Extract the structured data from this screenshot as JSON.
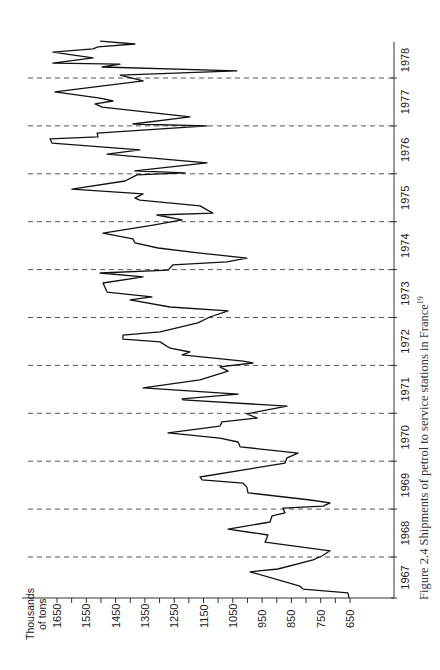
{
  "chart_data": {
    "type": "line",
    "orientation": "rotated-90",
    "title": "Figure 2.4   Shipments of petrol to service stations in France",
    "title_superscript": "19",
    "xlabel": "",
    "ylabel": "Thousands of tons",
    "ylabel_lines": [
      "Thousands",
      "of  tons"
    ],
    "ylim": [
      650,
      1650
    ],
    "yticks": [
      1650,
      1550,
      1450,
      1350,
      1250,
      1150,
      1050,
      950,
      850,
      750,
      650
    ],
    "xlim": [
      1967,
      1979
    ],
    "xticks": [
      "1967",
      "1968",
      "1969",
      "1970",
      "1971",
      "1972",
      "1973",
      "1974",
      "1975",
      "1976",
      "1977",
      "1978"
    ],
    "year_boundaries": [
      1968,
      1969,
      1970,
      1971,
      1972,
      1973,
      1974,
      1975,
      1976,
      1977,
      1978
    ],
    "grid": "dashed lines at year boundaries",
    "legend": "none",
    "series": [
      {
        "name": "Petrol shipments",
        "points": [
          [
            1967.14,
            653
          ],
          [
            1967.25,
            657
          ],
          [
            1967.33,
            810
          ],
          [
            1967.39,
            821
          ],
          [
            1967.69,
            991
          ],
          [
            1967.75,
            896
          ],
          [
            1967.94,
            776
          ],
          [
            1968.02,
            746
          ],
          [
            1968.13,
            718
          ],
          [
            1968.31,
            940
          ],
          [
            1968.46,
            930
          ],
          [
            1968.58,
            1066
          ],
          [
            1968.73,
            923
          ],
          [
            1968.86,
            916
          ],
          [
            1968.92,
            872
          ],
          [
            1969.02,
            879
          ],
          [
            1969.06,
            742
          ],
          [
            1969.13,
            718
          ],
          [
            1969.19,
            786
          ],
          [
            1969.34,
            998
          ],
          [
            1969.46,
            1002
          ],
          [
            1969.54,
            1015
          ],
          [
            1969.61,
            1155
          ],
          [
            1969.67,
            1162
          ],
          [
            1969.96,
            872
          ],
          [
            1970.07,
            865
          ],
          [
            1970.17,
            827
          ],
          [
            1970.3,
            1025
          ],
          [
            1970.4,
            1032
          ],
          [
            1970.48,
            1094
          ],
          [
            1970.59,
            1271
          ],
          [
            1970.73,
            1094
          ],
          [
            1970.82,
            1087
          ],
          [
            1970.9,
            967
          ],
          [
            1970.99,
            1002
          ],
          [
            1971.15,
            865
          ],
          [
            1971.28,
            1220
          ],
          [
            1971.3,
            1223
          ],
          [
            1971.4,
            1032
          ],
          [
            1971.53,
            1356
          ],
          [
            1971.7,
            1162
          ],
          [
            1971.88,
            1066
          ],
          [
            1971.97,
            1094
          ],
          [
            1972.05,
            981
          ],
          [
            1972.09,
            1015
          ],
          [
            1972.22,
            1223
          ],
          [
            1972.28,
            1196
          ],
          [
            1972.36,
            1264
          ],
          [
            1972.49,
            1298
          ],
          [
            1972.55,
            1425
          ],
          [
            1972.63,
            1425
          ],
          [
            1972.7,
            1298
          ],
          [
            1972.89,
            1169
          ],
          [
            1973.01,
            1128
          ],
          [
            1973.14,
            1066
          ],
          [
            1973.22,
            1264
          ],
          [
            1973.37,
            1401
          ],
          [
            1973.43,
            1326
          ],
          [
            1973.53,
            1479
          ],
          [
            1973.72,
            1493
          ],
          [
            1973.85,
            1356
          ],
          [
            1973.93,
            1503
          ],
          [
            1973.99,
            1271
          ],
          [
            1974.1,
            1254
          ],
          [
            1974.16,
            1070
          ],
          [
            1974.24,
            1002
          ],
          [
            1974.35,
            1169
          ],
          [
            1974.45,
            1305
          ],
          [
            1974.56,
            1384
          ],
          [
            1974.64,
            1391
          ],
          [
            1974.76,
            1493
          ],
          [
            1974.93,
            1322
          ],
          [
            1975.04,
            1223
          ],
          [
            1975.14,
            1309
          ],
          [
            1975.18,
            1118
          ],
          [
            1975.33,
            1162
          ],
          [
            1975.45,
            1367
          ],
          [
            1975.49,
            1384
          ],
          [
            1975.58,
            1356
          ],
          [
            1975.68,
            1599
          ],
          [
            1975.85,
            1418
          ],
          [
            1975.98,
            1377
          ],
          [
            1976.02,
            1213
          ],
          [
            1976.06,
            1384
          ],
          [
            1976.23,
            1138
          ],
          [
            1976.41,
            1479
          ],
          [
            1976.5,
            1367
          ],
          [
            1976.64,
            1667
          ],
          [
            1976.73,
            1674
          ],
          [
            1976.77,
            1510
          ],
          [
            1976.85,
            1513
          ],
          [
            1977.0,
            1138
          ],
          [
            1977.04,
            1391
          ],
          [
            1977.19,
            1196
          ],
          [
            1977.39,
            1496
          ],
          [
            1977.46,
            1520
          ],
          [
            1977.52,
            1459
          ],
          [
            1977.58,
            1503
          ],
          [
            1977.71,
            1657
          ],
          [
            1977.94,
            1356
          ],
          [
            1978.06,
            1435
          ],
          [
            1978.15,
            1036
          ],
          [
            1978.23,
            1496
          ],
          [
            1978.29,
            1435
          ],
          [
            1978.31,
            1664
          ],
          [
            1978.42,
            1527
          ],
          [
            1978.54,
            1664
          ],
          [
            1978.61,
            1527
          ],
          [
            1978.65,
            1510
          ],
          [
            1978.71,
            1384
          ],
          [
            1978.77,
            1503
          ]
        ]
      }
    ]
  },
  "colors": {
    "line": "#111111",
    "axis": "#333333",
    "grid": "#555555",
    "text": "#222222",
    "background": "#ffffff"
  }
}
